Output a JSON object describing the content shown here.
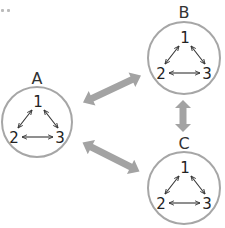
{
  "diagram": {
    "groups": [
      {
        "id": "A",
        "label": "A",
        "center": [
          37,
          122
        ],
        "radius": 35,
        "nodes": [
          "1",
          "2",
          "3"
        ]
      },
      {
        "id": "B",
        "label": "B",
        "center": [
          184,
          58
        ],
        "radius": 36,
        "nodes": [
          "1",
          "2",
          "3"
        ]
      },
      {
        "id": "C",
        "label": "C",
        "center": [
          184,
          188
        ],
        "radius": 36,
        "nodes": [
          "1",
          "2",
          "3"
        ]
      }
    ],
    "inner_edges": [
      {
        "from": "1",
        "to": "2",
        "type": "bidirectional"
      },
      {
        "from": "1",
        "to": "3",
        "type": "bidirectional"
      },
      {
        "from": "2",
        "to": "3",
        "type": "bidirectional"
      }
    ],
    "outer_edges": [
      {
        "from": "A",
        "to": "B",
        "type": "bidirectional"
      },
      {
        "from": "A",
        "to": "C",
        "type": "bidirectional"
      },
      {
        "from": "B",
        "to": "C",
        "type": "bidirectional"
      }
    ],
    "colors": {
      "circle_stroke": "#a6a6a6",
      "thick_arrow": "#a3a3a3",
      "thin_arrow": "#333333",
      "text": "#222222"
    }
  },
  "labels": {
    "A": "A",
    "B": "B",
    "C": "C",
    "n1": "1",
    "n2": "2",
    "n3": "3"
  }
}
